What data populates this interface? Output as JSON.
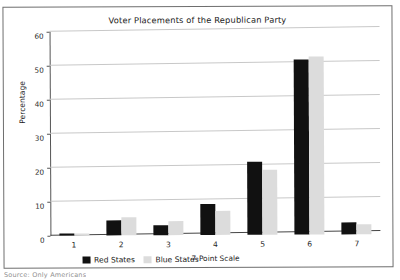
{
  "figure": {
    "title": "Voter Placements of the Republican Party",
    "source_note": "Source: Only Americans"
  },
  "legend": {
    "entries": [
      {
        "label": "Red States",
        "color": "#111111",
        "swatch": "red"
      },
      {
        "label": "Blue States",
        "color": "#dcdcdc",
        "swatch": "blue"
      }
    ]
  },
  "axes": {
    "ylabel": "Percentage",
    "xlabel": "7-Point Scale",
    "yticks": [
      "0",
      "10",
      "20",
      "30",
      "40",
      "50",
      "60"
    ],
    "xticks": [
      "1",
      "2",
      "3",
      "4",
      "5",
      "6",
      "7"
    ]
  },
  "chart_data": {
    "type": "bar",
    "title": "Voter Placements of the Republican Party",
    "xlabel": "7-Point Scale",
    "ylabel": "Percentage",
    "categories": [
      "1",
      "2",
      "3",
      "4",
      "5",
      "6",
      "7"
    ],
    "series": [
      {
        "name": "Red States",
        "color": "#111111",
        "values": [
          0.5,
          4.5,
          2.8,
          9.0,
          21.5,
          51.5,
          3.5
        ]
      },
      {
        "name": "Blue States",
        "color": "#dcdcdc",
        "values": [
          0.7,
          5.3,
          4.0,
          7.0,
          19.0,
          52.5,
          3.0
        ]
      }
    ],
    "ylim": [
      0,
      60
    ],
    "ytick_step": 10,
    "grid": "horizontal",
    "legend_position": "bottom-left"
  }
}
